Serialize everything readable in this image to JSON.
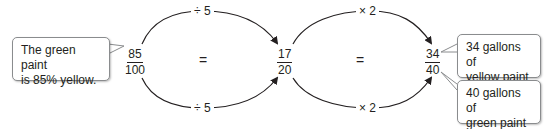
{
  "diagram": {
    "left_callout": {
      "line1": "The green paint",
      "line2": "is 85% yellow."
    },
    "fractions": [
      {
        "numerator": "85",
        "denominator": "100"
      },
      {
        "numerator": "17",
        "denominator": "20"
      },
      {
        "numerator": "34",
        "denominator": "40"
      }
    ],
    "equals": [
      "=",
      "="
    ],
    "operations": {
      "first_top": "÷ 5",
      "first_bottom": "÷ 5",
      "second_top": "× 2",
      "second_bottom": "× 2"
    },
    "right_callouts": [
      {
        "line1": "34 gallons of",
        "line2": "yellow paint"
      },
      {
        "line1": "40 gallons of",
        "line2": "green paint"
      }
    ],
    "colors": {
      "stroke": "#231f20",
      "callout_border": "#8a8c8e",
      "background": "#ffffff"
    }
  }
}
